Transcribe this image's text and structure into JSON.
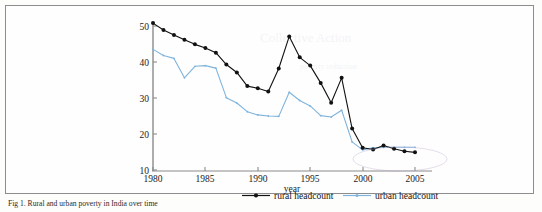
{
  "figure": {
    "caption": "Fig 1. Rural and urban poverty in India over time"
  },
  "axes": {
    "x_title": "year",
    "y_title": "",
    "x_ticks": [
      "1980",
      "1985",
      "1990",
      "1995",
      "2000",
      "2005"
    ],
    "y_ticks": [
      "10",
      "20",
      "30",
      "40",
      "50"
    ]
  },
  "legend": {
    "entries": [
      {
        "label": "rural headcount",
        "color": "#111111",
        "marker": "circle"
      },
      {
        "label": "urban headcount",
        "color": "#7fb4dd",
        "marker": "dot"
      }
    ]
  },
  "chart_data": {
    "type": "line",
    "title": "Rural and urban poverty in India over time",
    "xlabel": "year",
    "ylabel": "",
    "xlim": [
      1979.4,
      2006.2
    ],
    "ylim": [
      9.2,
      52.5
    ],
    "grid": false,
    "legend_position": "bottom",
    "x": [
      1980,
      1981,
      1982,
      1983,
      1984,
      1985,
      1986,
      1987,
      1988,
      1989,
      1990,
      1991,
      1992,
      1993,
      1994,
      1995,
      1996,
      1997,
      1998,
      1999,
      2000,
      2001,
      2002,
      2003,
      2004,
      2005
    ],
    "series": [
      {
        "name": "rural headcount",
        "color": "#111111",
        "values": [
          50.8,
          48.9,
          47.5,
          46.2,
          44.9,
          43.9,
          42.6,
          39.3,
          37.1,
          33.3,
          32.7,
          31.8,
          38.2,
          47.1,
          41.3,
          39.0,
          34.2,
          28.7,
          35.6,
          21.5,
          16.2,
          15.7,
          16.8,
          15.9,
          15.2,
          14.9
        ]
      },
      {
        "name": "urban headcount",
        "color": "#7fb4dd",
        "values": [
          43.5,
          41.8,
          41.0,
          35.6,
          38.8,
          39.0,
          38.3,
          30.1,
          28.6,
          26.2,
          25.3,
          25.0,
          24.9,
          31.6,
          29.3,
          27.8,
          25.1,
          24.7,
          26.6,
          17.8,
          15.6,
          16.2,
          16.3,
          16.3,
          16.3,
          16.3
        ]
      }
    ]
  }
}
